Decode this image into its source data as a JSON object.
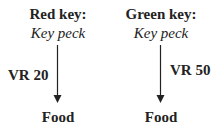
{
  "left": {
    "title": "Red key:",
    "response": "Key peck",
    "schedule": "VR 20",
    "outcome": "Food"
  },
  "right": {
    "title": "Green key:",
    "response": "Key peck",
    "schedule": "VR 50",
    "outcome": "Food"
  }
}
